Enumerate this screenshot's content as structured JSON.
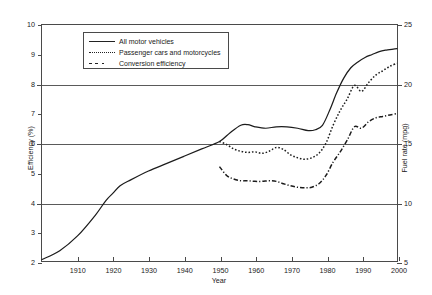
{
  "chart_data": {
    "type": "line",
    "title": "",
    "xlabel": "Year",
    "ylabel": "Efficiency (%)",
    "ylabel_right": "Fuel rate (mpg)",
    "xlim": [
      1900,
      2000
    ],
    "ylim": [
      2,
      10
    ],
    "ylim_right": [
      5,
      25
    ],
    "grid": true,
    "gridlines_y": [
      4,
      6,
      8
    ],
    "legend_position": "top-center",
    "xticks": [
      1910,
      1920,
      1930,
      1940,
      1950,
      1960,
      1970,
      1980,
      1990,
      2000
    ],
    "xtick_labels": [
      "1910",
      "1920",
      "1930",
      "1940",
      "1950",
      "1960",
      "1970",
      "1980",
      "1990",
      "2000"
    ],
    "yticks": [
      2,
      3,
      4,
      5,
      6,
      7,
      8,
      9,
      10
    ],
    "ytick_labels": [
      "2",
      "3",
      "4",
      "5",
      "6",
      "7",
      "8",
      "9",
      "10"
    ],
    "yticks_right": [
      5,
      10,
      15,
      20,
      25
    ],
    "ytick_labels_right": [
      "5",
      "10",
      "15",
      "20",
      "25"
    ],
    "series": [
      {
        "name": "All motor vehicles",
        "style": "solid",
        "x": [
          1900,
          1905,
          1910,
          1915,
          1918,
          1920,
          1922,
          1925,
          1930,
          1935,
          1940,
          1945,
          1950,
          1953,
          1956,
          1958,
          1960,
          1963,
          1966,
          1969,
          1972,
          1975,
          1977,
          1979,
          1981,
          1983,
          1985,
          1987,
          1989,
          1991,
          1993,
          1995,
          1997,
          2000
        ],
        "y": [
          2.05,
          2.35,
          2.85,
          3.55,
          4.05,
          4.3,
          4.55,
          4.75,
          5.05,
          5.3,
          5.55,
          5.8,
          6.05,
          6.35,
          6.6,
          6.62,
          6.55,
          6.5,
          6.55,
          6.55,
          6.5,
          6.42,
          6.45,
          6.6,
          7.1,
          7.7,
          8.2,
          8.55,
          8.75,
          8.9,
          9.0,
          9.1,
          9.15,
          9.2
        ]
      },
      {
        "name": "Passenger cars and motorcycles",
        "style": "dotted",
        "x": [
          1950,
          1952,
          1954,
          1956,
          1958,
          1960,
          1962,
          1964,
          1966,
          1968,
          1970,
          1972,
          1974,
          1976,
          1978,
          1980,
          1982,
          1984,
          1986,
          1988,
          1990,
          1992,
          1994,
          1996,
          1998,
          2000
        ],
        "y": [
          6.05,
          5.95,
          5.8,
          5.72,
          5.68,
          5.7,
          5.65,
          5.72,
          5.85,
          5.78,
          5.6,
          5.5,
          5.45,
          5.5,
          5.65,
          6.0,
          6.6,
          7.1,
          7.5,
          7.95,
          7.75,
          8.05,
          8.3,
          8.45,
          8.6,
          8.7
        ]
      },
      {
        "name": "Conversion efficiency",
        "style": "dashdot",
        "x": [
          1950,
          1952,
          1954,
          1956,
          1958,
          1960,
          1962,
          1964,
          1966,
          1968,
          1970,
          1972,
          1974,
          1976,
          1978,
          1980,
          1982,
          1984,
          1986,
          1988,
          1990,
          1992,
          1994,
          1996,
          1998,
          2000
        ],
        "y": [
          5.2,
          4.9,
          4.78,
          4.72,
          4.72,
          4.7,
          4.7,
          4.72,
          4.7,
          4.62,
          4.55,
          4.5,
          4.48,
          4.5,
          4.62,
          4.9,
          5.35,
          5.7,
          6.1,
          6.55,
          6.5,
          6.72,
          6.85,
          6.9,
          6.95,
          7.0
        ]
      }
    ]
  },
  "legend": {
    "items": [
      {
        "label": "All motor vehicles",
        "style": "solid"
      },
      {
        "label": "Passenger cars and motorcycles",
        "style": "dotted"
      },
      {
        "label": "Conversion efficiency",
        "style": "dashdot"
      }
    ]
  }
}
